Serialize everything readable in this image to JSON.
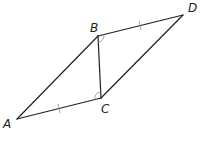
{
  "diagram": {
    "type": "geometry",
    "title": "",
    "points": {
      "A": {
        "label": "A",
        "x": 17,
        "y": 119
      },
      "B": {
        "label": "B",
        "x": 98,
        "y": 36
      },
      "C": {
        "label": "C",
        "x": 101,
        "y": 98
      },
      "D": {
        "label": "D",
        "x": 183,
        "y": 15
      }
    },
    "segments": [
      {
        "from": "A",
        "to": "B"
      },
      {
        "from": "A",
        "to": "C",
        "congruence_ticks": 1
      },
      {
        "from": "B",
        "to": "C"
      },
      {
        "from": "B",
        "to": "D",
        "congruence_ticks": 1
      },
      {
        "from": "C",
        "to": "D"
      }
    ],
    "angle_marks": [
      {
        "vertex": "B",
        "between": [
          "C",
          "D"
        ],
        "arcs": 1
      },
      {
        "vertex": "C",
        "between": [
          "A",
          "B"
        ],
        "arcs": 1
      }
    ],
    "colors": {
      "line": "#231f20",
      "marks": "#9a9a9a"
    }
  }
}
